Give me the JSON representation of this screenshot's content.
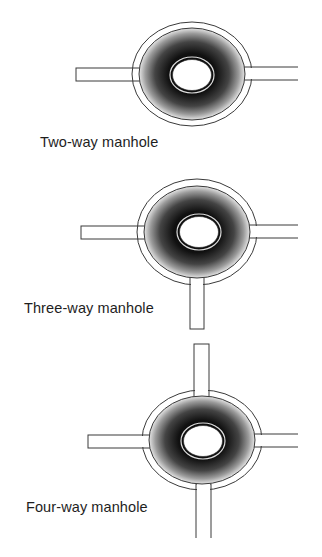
{
  "figure": {
    "title": "",
    "manholes": [
      {
        "label": "Two-way manhole",
        "connections": 2,
        "pipes": [
          "left",
          "right"
        ]
      },
      {
        "label": "Three-way manhole",
        "connections": 3,
        "pipes": [
          "left",
          "right",
          "bottom"
        ]
      },
      {
        "label": "Four-way manhole",
        "connections": 4,
        "pipes": [
          "top",
          "left",
          "right",
          "bottom"
        ]
      }
    ],
    "colors": {
      "line": "#3a3a3a",
      "shade_dark": "#111111",
      "shade_light": "#e8e8e8",
      "background": "#ffffff"
    }
  }
}
